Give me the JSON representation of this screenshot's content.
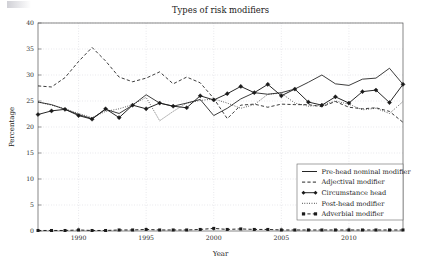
{
  "chart_data": {
    "type": "line",
    "title": "Types of risk modifiers",
    "xlabel": "Year",
    "ylabel": "Percentage",
    "xlim": [
      1987,
      2014
    ],
    "ylim": [
      0,
      40
    ],
    "xticks": [
      1990,
      1995,
      2000,
      2005,
      2010
    ],
    "yticks": [
      0,
      5,
      10,
      15,
      20,
      25,
      30,
      35,
      40
    ],
    "grid": true,
    "legend_position": "lower right",
    "x": [
      1987,
      1988,
      1989,
      1990,
      1991,
      1992,
      1993,
      1994,
      1995,
      1996,
      1997,
      1998,
      1999,
      2000,
      2001,
      2002,
      2003,
      2004,
      2005,
      2006,
      2007,
      2008,
      2009,
      2010,
      2011,
      2012,
      2013,
      2014
    ],
    "series": [
      {
        "name": "Pre-head nominal modifier",
        "style": "solid",
        "marker": "none",
        "values": [
          24.8,
          24.3,
          23.4,
          22.4,
          21.6,
          23.4,
          22.6,
          24.2,
          26.2,
          24.6,
          24.0,
          24.6,
          25.3,
          22.2,
          23.6,
          25.4,
          26.6,
          26.3,
          26.6,
          27.3,
          28.6,
          30.0,
          28.3,
          28.0,
          29.2,
          29.4,
          31.3,
          28.2
        ]
      },
      {
        "name": "Adjectival modifier",
        "style": "dashed",
        "marker": "none",
        "values": [
          27.9,
          27.7,
          29.5,
          32.6,
          35.3,
          32.7,
          29.6,
          28.7,
          29.4,
          30.6,
          28.3,
          29.6,
          28.5,
          25.5,
          21.6,
          24.2,
          24.4,
          23.8,
          24.4,
          24.3,
          24.3,
          23.9,
          24.9,
          23.8,
          23.5,
          23.7,
          23.0,
          20.9
        ]
      },
      {
        "name": "Circumstance head",
        "style": "solid",
        "marker": "diamond",
        "values": [
          22.4,
          23.1,
          23.4,
          22.2,
          21.5,
          23.5,
          21.8,
          24.2,
          23.5,
          24.6,
          24.0,
          23.7,
          26.0,
          25.2,
          26.4,
          27.8,
          26.6,
          28.2,
          26.0,
          27.3,
          24.8,
          24.2,
          25.8,
          24.6,
          26.8,
          27.1,
          24.7,
          28.2
        ]
      },
      {
        "name": "Post-head modifier",
        "style": "dotted",
        "marker": "none",
        "values": [
          24.8,
          24.2,
          23.5,
          22.6,
          21.8,
          23.0,
          23.5,
          24.3,
          25.7,
          21.2,
          23.0,
          24.6,
          25.1,
          25.4,
          24.6,
          23.6,
          24.3,
          26.3,
          26.5,
          24.6,
          24.0,
          24.2,
          25.0,
          24.4,
          23.3,
          23.6,
          22.6,
          24.9
        ]
      },
      {
        "name": "Adverbial modifier",
        "style": "dashed",
        "marker": "square",
        "values": [
          0.1,
          0.1,
          0.1,
          0.2,
          0.1,
          0.1,
          0.2,
          0.2,
          0.3,
          0.2,
          0.2,
          0.2,
          0.3,
          0.5,
          0.3,
          0.4,
          0.3,
          0.3,
          0.2,
          0.2,
          0.2,
          0.2,
          0.2,
          0.2,
          0.2,
          0.2,
          0.2,
          0.2
        ]
      }
    ]
  },
  "legend": {
    "items": [
      {
        "label": "Pre-head nominal modifier"
      },
      {
        "label": "Adjectival modifier"
      },
      {
        "label": "Circumstance head"
      },
      {
        "label": "Post-head modifier"
      },
      {
        "label": "Adverbial modifier"
      }
    ]
  },
  "colors": {
    "line": "#1a1a1a",
    "grid": "#b9b9c4",
    "frame": "#555555",
    "background": "#ffffff"
  }
}
